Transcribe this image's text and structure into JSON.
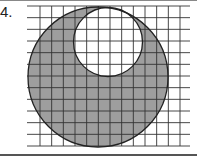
{
  "problem": {
    "number_label": "4."
  },
  "figure": {
    "type": "shaded-region-on-grid",
    "grid": {
      "x_start": 40,
      "x_end": 180,
      "h_line_x_start": 27,
      "h_line_x_end": 190,
      "y_start": 6,
      "y_end": 146,
      "columns": 12,
      "rows": 12
    },
    "outer_circle": {
      "cx": 98,
      "cy": 77,
      "r": 70
    },
    "inner_circle": {
      "cx": 108,
      "cy": 42,
      "r": 34.5
    },
    "colors": {
      "shade": "#9e9e9e",
      "grid_line": "#333333",
      "outline": "#222222",
      "background": "#ffffff"
    }
  }
}
